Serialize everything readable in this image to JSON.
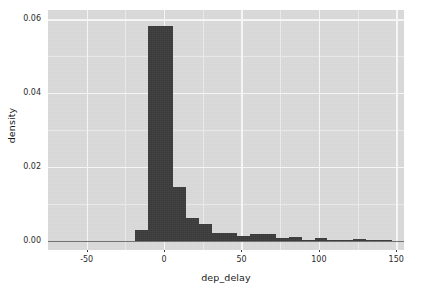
{
  "chart_data": {
    "type": "bar",
    "title": "",
    "subtitle": "",
    "xlabel": "dep_delay",
    "ylabel": "density",
    "xlim": [
      -75,
      155
    ],
    "ylim": [
      -0.0025,
      0.0625
    ],
    "grid": true,
    "legend": null,
    "x_ticks": [
      {
        "value": -50,
        "label": "-50"
      },
      {
        "value": 0,
        "label": "0"
      },
      {
        "value": 50,
        "label": "50"
      },
      {
        "value": 100,
        "label": "100"
      },
      {
        "value": 150,
        "label": "150"
      }
    ],
    "y_ticks": [
      {
        "value": 0.0,
        "label": "0.00"
      },
      {
        "value": 0.02,
        "label": "0.02"
      },
      {
        "value": 0.04,
        "label": "0.04"
      },
      {
        "value": 0.06,
        "label": "0.06"
      }
    ],
    "x_minor_ticks": [
      -25,
      25,
      75,
      125
    ],
    "y_minor_ticks": [
      0.01,
      0.03,
      0.05
    ],
    "bin_width": 8.3,
    "bar_color": "#3a3a3a",
    "panel_color": "#d9d9d9",
    "gridline_color": "#f7f7f7",
    "bins": [
      {
        "x0": -19.0,
        "x1": -10.7,
        "density": 0.0
      },
      {
        "x0": -19.0,
        "x1": -10.7,
        "density": 0.0029
      },
      {
        "x0": -10.7,
        "x1": -2.4,
        "density": 0.0581
      },
      {
        "x0": -2.4,
        "x1": 5.9,
        "density": 0.0581
      },
      {
        "x0": 5.9,
        "x1": 14.2,
        "density": 0.0146
      },
      {
        "x0": 14.2,
        "x1": 22.5,
        "density": 0.0063
      },
      {
        "x0": 22.5,
        "x1": 30.8,
        "density": 0.0046
      },
      {
        "x0": 30.8,
        "x1": 39.1,
        "density": 0.0022
      },
      {
        "x0": 39.1,
        "x1": 47.4,
        "density": 0.0021
      },
      {
        "x0": 47.4,
        "x1": 55.7,
        "density": 0.0014
      },
      {
        "x0": 55.7,
        "x1": 64.0,
        "density": 0.0018
      },
      {
        "x0": 64.0,
        "x1": 72.3,
        "density": 0.0018
      },
      {
        "x0": 72.3,
        "x1": 80.6,
        "density": 0.0008
      },
      {
        "x0": 80.6,
        "x1": 88.9,
        "density": 0.0009
      },
      {
        "x0": 88.9,
        "x1": 97.2,
        "density": 0.0002
      },
      {
        "x0": 97.2,
        "x1": 105.5,
        "density": 0.0008
      },
      {
        "x0": 105.5,
        "x1": 113.8,
        "density": 0.0002
      },
      {
        "x0": 113.8,
        "x1": 122.1,
        "density": 0.0002
      },
      {
        "x0": 122.1,
        "x1": 130.4,
        "density": 0.0006
      },
      {
        "x0": 130.4,
        "x1": 138.7,
        "density": 0.0001
      },
      {
        "x0": 138.7,
        "x1": 147.0,
        "density": 0.0001
      }
    ]
  }
}
